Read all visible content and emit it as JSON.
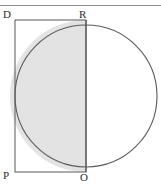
{
  "figure": {
    "kind": "geometry-diagram",
    "labels": {
      "top_left": "D",
      "top_right": "R",
      "bottom_left": "P",
      "bottom_right": "O"
    },
    "colors": {
      "background": "#ffffff",
      "stroke": "#595959",
      "rule": "#8f8f8f",
      "shade_fill": "#e3e3e3",
      "label_text": "#2b2b2b"
    },
    "geometry": {
      "top_rule_y": 5,
      "rectangle": {
        "x": 15,
        "y": 20,
        "width": 71,
        "height": 152
      },
      "circle": {
        "cx": 86,
        "cy": 96,
        "r": 71
      },
      "chord_line": {
        "x": 86,
        "y1": 20,
        "y2": 172
      },
      "shaded_half": "left"
    }
  }
}
